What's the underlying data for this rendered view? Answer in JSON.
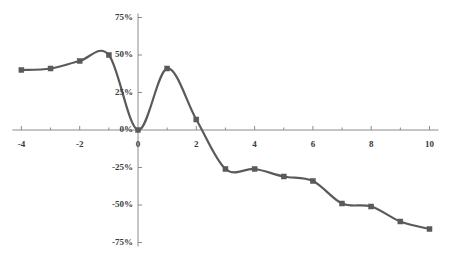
{
  "chart_data": {
    "type": "line",
    "title": "",
    "subtitle": "",
    "xlabel": "",
    "ylabel": "",
    "xlim": [
      -4,
      10
    ],
    "ylim": [
      -75,
      75
    ],
    "grid": false,
    "legend": null,
    "legend_position": "none",
    "series_color": "#5a5a5a",
    "marker": "square",
    "smoothing": "spline",
    "x": [
      -4,
      -3,
      -2,
      -1,
      0,
      1,
      2,
      3,
      4,
      5,
      6,
      7,
      8,
      9,
      10
    ],
    "values": [
      40,
      41,
      46,
      50,
      0,
      41,
      7,
      -26,
      -26,
      -31,
      -34,
      -49,
      -51,
      -61,
      -66
    ],
    "series": [
      {
        "name": "",
        "values": [
          40,
          41,
          46,
          50,
          0,
          41,
          7,
          -26,
          -26,
          -31,
          -34,
          -49,
          -51,
          -61,
          -66
        ]
      }
    ],
    "y_ticks": [
      75,
      50,
      25,
      0,
      -25,
      -50,
      -75
    ],
    "y_tick_labels": [
      "75%",
      "50%",
      "25%",
      "0%",
      "-25%",
      "-50%",
      "-75%"
    ],
    "x_ticks": [
      -4,
      -2,
      0,
      2,
      4,
      6,
      8,
      10
    ],
    "x_tick_labels": [
      "-4",
      "-2",
      "0",
      "2",
      "4",
      "6",
      "8",
      "10"
    ],
    "x_minor_ticks": [
      -4,
      -3,
      -2,
      -1,
      0,
      1,
      2,
      3,
      4,
      5,
      6,
      7,
      8,
      9,
      10
    ],
    "axis_color": "#8c8c8c",
    "text_color": "#3a3a3a"
  },
  "axes": {
    "y_labels": [
      {
        "text": "75%",
        "value": 75
      },
      {
        "text": "50%",
        "value": 50
      },
      {
        "text": "25%",
        "value": 25
      },
      {
        "text": "0%",
        "value": 0
      },
      {
        "text": "-25%",
        "value": -25
      },
      {
        "text": "-50%",
        "value": -50
      },
      {
        "text": "-75%",
        "value": -75
      }
    ],
    "x_labels": [
      {
        "text": "-4",
        "value": -4
      },
      {
        "text": "-2",
        "value": -2
      },
      {
        "text": "0",
        "value": 0
      },
      {
        "text": "2",
        "value": 2
      },
      {
        "text": "4",
        "value": 4
      },
      {
        "text": "6",
        "value": 6
      },
      {
        "text": "8",
        "value": 8
      },
      {
        "text": "10",
        "value": 10
      }
    ]
  }
}
